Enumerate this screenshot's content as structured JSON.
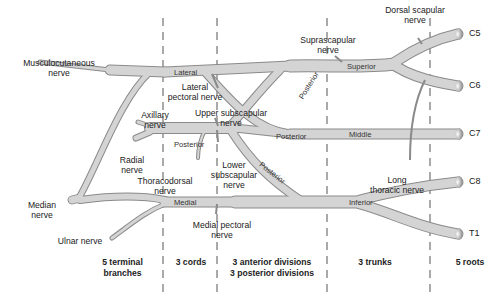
{
  "diagram": {
    "type": "brachial-plexus-schematic",
    "colors": {
      "nerve_fill": "#d4d4d4",
      "nerve_outline": "#8a8a8a",
      "divider": "#555555",
      "text": "#222222"
    },
    "roots": [
      "C5",
      "C6",
      "C7",
      "C8",
      "T1"
    ],
    "trunks": {
      "superior": "Superior",
      "middle": "Middle",
      "inferior": "Inferior"
    },
    "divisions": {
      "posterior_1": "Posterior",
      "posterior_2": "Posterior",
      "posterior_3": "Posterior"
    },
    "cords": {
      "lateral": "Lateral",
      "posterior": "Posterior",
      "medial": "Medial"
    },
    "branches": {
      "dorsal_scapular": [
        "Dorsal scapular",
        "nerve"
      ],
      "suprascapular": [
        "Suprascapular",
        "nerve"
      ],
      "long_thoracic": [
        "Long",
        "thoracic nerve"
      ],
      "lateral_pectoral": [
        "Lateral",
        "pectoral nerve"
      ],
      "upper_subscapular": [
        "Upper subscapular",
        "nerve"
      ],
      "lower_subscapular": [
        "Lower",
        "subscapular",
        "nerve"
      ],
      "thoracodorsal": [
        "Thoracodorsal",
        "nerve"
      ],
      "medial_pectoral": [
        "Medial pectoral",
        "nerve"
      ],
      "musculocutaneous": [
        "Musculocutaneous",
        "nerve"
      ],
      "axillary": [
        "Axillary",
        "nerve"
      ],
      "radial": [
        "Radial",
        "nerve"
      ],
      "median": [
        "Median",
        "nerve"
      ],
      "ulnar": [
        "Ulnar nerve"
      ]
    },
    "sections": [
      {
        "id": "terminal",
        "lines": [
          "5 terminal",
          "branches"
        ]
      },
      {
        "id": "cords",
        "lines": [
          "3 cords"
        ]
      },
      {
        "id": "divisions",
        "lines": [
          "3 anterior divisions",
          "3 posterior divisions"
        ]
      },
      {
        "id": "trunks",
        "lines": [
          "3 trunks"
        ]
      },
      {
        "id": "roots",
        "lines": [
          "5 roots"
        ]
      }
    ]
  }
}
